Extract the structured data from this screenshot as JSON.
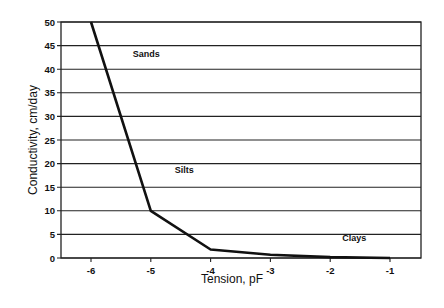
{
  "chart_data": {
    "type": "line",
    "title": "",
    "xlabel": "Tension, pF",
    "ylabel": "Conductivity, cm/day",
    "xlim": [
      -6.5,
      -1
    ],
    "ylim": [
      0,
      50
    ],
    "x_ticks": [
      -6,
      -5,
      -4,
      -3,
      -2,
      -1
    ],
    "y_ticks": [
      0,
      5,
      10,
      15,
      20,
      25,
      30,
      35,
      40,
      45,
      50
    ],
    "grid": {
      "horizontal": true,
      "vertical": false
    },
    "legend": null,
    "series": [
      {
        "name": "Hydraulic conductivity",
        "x": [
          -6,
          -5,
          -4,
          -3,
          -2,
          -1
        ],
        "y": [
          50,
          10,
          1.8,
          0.7,
          0.2,
          0
        ]
      }
    ],
    "annotations": [
      {
        "text": "Sands",
        "x": -5.3,
        "y": 42.5
      },
      {
        "text": "Silts",
        "x": -4.6,
        "y": 18
      },
      {
        "text": "Clays",
        "x": -1.8,
        "y": 3.5
      }
    ],
    "colors": {
      "line": "#111111",
      "grid": "#222222",
      "background": "#ffffff"
    }
  }
}
